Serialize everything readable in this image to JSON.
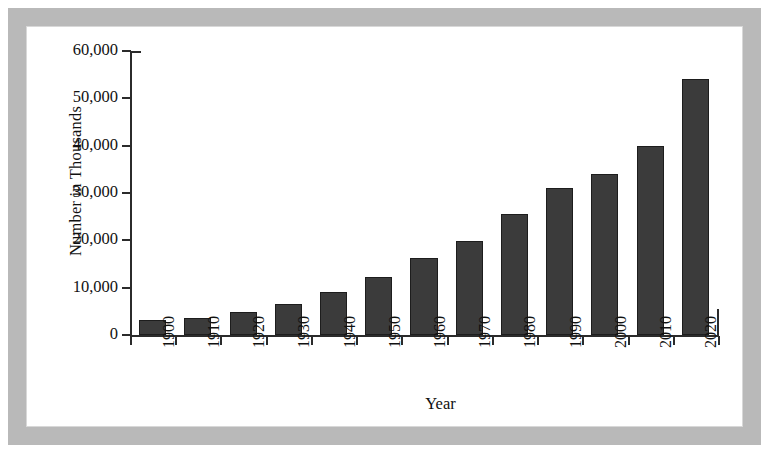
{
  "figure": {
    "frame_color": "#b9b9b9",
    "background": "#ffffff"
  },
  "chart_data": {
    "type": "bar",
    "title": "",
    "subtitle": "",
    "xlabel": "Year",
    "ylabel": "Number in Thousands",
    "categories": [
      "1900",
      "1910",
      "1920",
      "1930",
      "1940",
      "1950",
      "1960",
      "1970",
      "1980",
      "1990",
      "2000",
      "2010",
      "2020"
    ],
    "values": [
      3100,
      3600,
      4900,
      6600,
      9000,
      12300,
      16200,
      19900,
      25500,
      31000,
      34000,
      40000,
      54000
    ],
    "series": [
      {
        "name": "Number in Thousands",
        "values": [
          3100,
          3600,
          4900,
          6600,
          9000,
          12300,
          16200,
          19900,
          25500,
          31000,
          34000,
          40000,
          54000
        ]
      }
    ],
    "ylim": [
      0,
      60000
    ],
    "ytick_values": [
      0,
      10000,
      20000,
      30000,
      40000,
      50000,
      60000
    ],
    "ytick_labels": [
      "0",
      "10,000",
      "20,000",
      "30,000",
      "40,000",
      "50,000",
      "60,000"
    ],
    "grid": false,
    "legend": false,
    "legend_position": "none",
    "bar_color": "#3b3b3b",
    "bar_edge_color": "#1d1d1d",
    "axis_color": "#2b2b2b",
    "xtick_rotation": 90
  }
}
